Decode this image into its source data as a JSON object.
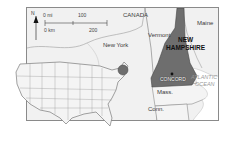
{
  "map": {
    "title": "New Hampshire location map",
    "highlight_color": "#6e6e6e",
    "land_color": "#f1f1f1",
    "water_color": "#ffffff",
    "border_color": "#8a8a8a",
    "north_arrow": {
      "label": "N"
    },
    "scale_bar": {
      "miles_label": "0 mi",
      "miles_end": "100",
      "km_label": "0 km",
      "km_end": "200"
    },
    "labels": {
      "canada": "CANADA",
      "new_york": "New York",
      "vermont": "Vermont",
      "maine": "Maine",
      "nh_line1": "NEW",
      "nh_line2": "HAMPSHIRE",
      "capital": "CONCORD",
      "ocean_line1": "ATLANTIC",
      "ocean_line2": "OCEAN",
      "massachusetts": "Mass.",
      "connecticut": "Conn."
    },
    "inset": {
      "description": "Map of contiguous United States with New Hampshire region circled"
    }
  }
}
